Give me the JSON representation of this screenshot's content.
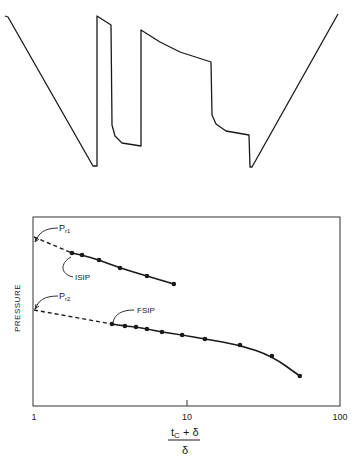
{
  "chart_data": [
    {
      "type": "line",
      "title": "",
      "description": "Pressure vs. time chart trace of a drill-stem test (two flow periods and two shut-in periods)",
      "xlabel": "",
      "ylabel": "",
      "grid": false,
      "trace_points_px": [
        [
          5,
          16
        ],
        [
          8,
          17
        ],
        [
          93,
          166
        ],
        [
          97,
          166
        ],
        [
          97,
          16
        ],
        [
          111,
          25
        ],
        [
          112,
          125
        ],
        [
          115,
          136
        ],
        [
          122,
          143
        ],
        [
          141,
          146
        ],
        [
          141,
          30
        ],
        [
          160,
          42
        ],
        [
          180,
          52
        ],
        [
          211,
          62
        ],
        [
          212,
          115
        ],
        [
          216,
          124
        ],
        [
          226,
          131
        ],
        [
          249,
          135
        ],
        [
          250,
          167
        ],
        [
          252,
          167
        ],
        [
          338,
          14
        ]
      ]
    },
    {
      "type": "scatter",
      "title": "",
      "xlabel": "(t_c + δ) / δ",
      "ylabel": "PRESSURE",
      "xscale": "log",
      "xlim": [
        1,
        100
      ],
      "xticks": [
        1,
        10,
        100
      ],
      "xtick_labels": [
        "1",
        "10",
        "100"
      ],
      "grid": false,
      "series": [
        {
          "name": "ISIP",
          "x": [
            1.77,
            2.06,
            2.66,
            3.65,
            5.47,
            8.2
          ],
          "y": [
            154,
            152,
            147,
            139,
            131,
            123
          ],
          "extrapolation": {
            "to_x": 1,
            "y": 170,
            "label": "Pr1",
            "style": "dashed"
          }
        },
        {
          "name": "FSIP",
          "x": [
            3.23,
            3.93,
            4.64,
            5.47,
            6.86,
            9.3,
            13.1,
            22.2,
            35.9,
            54.6
          ],
          "y": [
            83,
            81,
            80,
            78,
            75,
            72,
            68,
            62,
            51,
            31
          ],
          "extrapolation": {
            "to_x": 1,
            "y": 97,
            "label": "Pr2",
            "style": "dashed"
          }
        }
      ],
      "annotations": [
        "Pr1",
        "ISIP",
        "Pr2",
        "FSIP"
      ]
    }
  ],
  "labels": {
    "y_axis": "PRESSURE",
    "x_num": "t",
    "x_num_sub": "C",
    "x_plus": " + δ",
    "x_den": "δ",
    "tick_1": "1",
    "tick_10": "10",
    "tick_100": "100",
    "pr1": "P",
    "pr1_sub": "r1",
    "pr2": "P",
    "pr2_sub": "r2",
    "isip": "ISIP",
    "fsip": "FSIP"
  }
}
